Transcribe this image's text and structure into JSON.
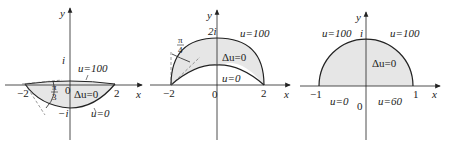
{
  "panels": [
    {
      "axis_x": "x",
      "axis_y": "y",
      "origin": "0",
      "ticks_x": [
        "−2",
        "2"
      ],
      "ticks_y_pos": "i",
      "ticks_y_neg": "−i",
      "angle_num": "π",
      "angle_den": "3",
      "boundary_top": "u=100",
      "boundary_bottom": "u=0",
      "equation": "Δu=0"
    },
    {
      "axis_x": "x",
      "axis_y": "y",
      "origin": "0",
      "ticks_x": [
        "−2",
        "2"
      ],
      "ticks_y_pos": "2i",
      "angle_num": "π",
      "angle_den": "4",
      "boundary_top": "u=100",
      "boundary_bottom": "u=0",
      "equation": "Δu=0"
    },
    {
      "axis_x": "x",
      "axis_y": "y",
      "origin": "0",
      "ticks_x": [
        "−1",
        "1"
      ],
      "ticks_y_pos": "i",
      "boundary_left_arc": "u=100",
      "boundary_right_arc": "u=100",
      "boundary_left_seg": "u=0",
      "boundary_right_seg": "u=60",
      "equation": "Δu=0"
    }
  ],
  "colors": {
    "fill": "#e6e6e6",
    "stroke": "#222222"
  }
}
